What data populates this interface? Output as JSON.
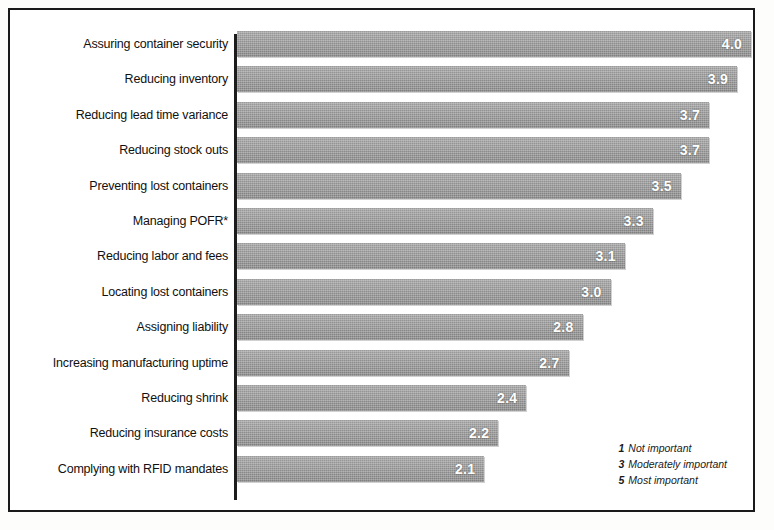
{
  "chart_data": {
    "type": "bar",
    "orientation": "horizontal",
    "title": "",
    "xlabel": "",
    "ylabel": "",
    "xlim": [
      0,
      5
    ],
    "grid": false,
    "categories": [
      "Assuring container security",
      "Reducing inventory",
      "Reducing lead time variance",
      "Reducing stock outs",
      "Preventing lost containers",
      "Managing POFR*",
      "Reducing labor and fees",
      "Locating lost containers",
      "Assigning liability",
      "Increasing manufacturing uptime",
      "Reducing shrink",
      "Reducing insurance costs",
      "Complying with RFID mandates"
    ],
    "values": [
      4.0,
      3.9,
      3.7,
      3.7,
      3.5,
      3.3,
      3.1,
      3.0,
      2.8,
      2.7,
      2.4,
      2.2,
      2.1
    ],
    "value_labels": [
      "4.0",
      "3.9",
      "3.7",
      "3.7",
      "3.5",
      "3.3",
      "3.1",
      "3.0",
      "2.8",
      "2.7",
      "2.4",
      "2.2",
      "2.1"
    ],
    "bar_color": "#8c8c8c",
    "value_label_color": "#ffffff",
    "legend_position": "bottom-right"
  },
  "legend": {
    "entries": [
      {
        "key": "1",
        "label": "Not important"
      },
      {
        "key": "3",
        "label": "Moderately important"
      },
      {
        "key": "5",
        "label": "Most important"
      }
    ]
  }
}
